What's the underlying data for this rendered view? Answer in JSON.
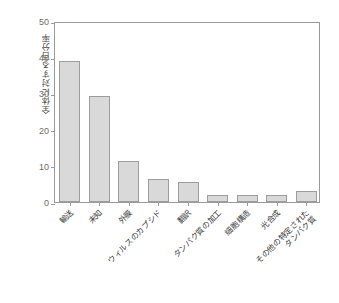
{
  "chart_data": {
    "type": "bar",
    "title": "",
    "xlabel": "",
    "ylabel": "全体に対する百分率",
    "ylim": [
      0,
      50
    ],
    "yticks": [
      0,
      10,
      20,
      30,
      40,
      50
    ],
    "ytick_labels": [
      "0",
      "10",
      "20",
      "30",
      "40",
      "50"
    ],
    "grid": false,
    "legend": null,
    "categories": [
      "輸送",
      "未知",
      "外膜",
      "ウィルスのカプシド",
      "翻訳",
      "タンパク質の加工",
      "細胞構造",
      "光合成",
      "その他の特定された タンパク質"
    ],
    "category_lines": [
      [
        "輸送"
      ],
      [
        "未知"
      ],
      [
        "外膜"
      ],
      [
        "ウィルスのカプシド"
      ],
      [
        "翻訳"
      ],
      [
        "タンパク質の加工"
      ],
      [
        "細胞構造"
      ],
      [
        "光合成"
      ],
      [
        "その他の特定された",
        "タンパク質"
      ]
    ],
    "values": [
      39.0,
      29.3,
      11.2,
      6.3,
      5.6,
      1.8,
      1.8,
      1.8,
      3.0
    ],
    "bar_color": "#d9d9d9",
    "bar_edge_color": "#9d9d9d",
    "axis_color": "#9a9a9a",
    "tick_label_color": "#6b6b6b",
    "label_color": "#3c3c3c"
  }
}
